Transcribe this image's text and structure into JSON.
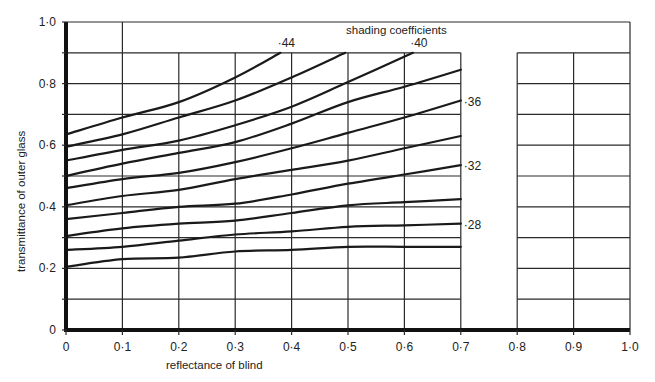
{
  "chart_data": {
    "type": "line",
    "title": "shading coefficients",
    "xlabel": "reflectance of blind",
    "ylabel": "transmittance of outer glass",
    "xlim": [
      0,
      1.0
    ],
    "ylim": [
      0,
      1.0
    ],
    "x_ticks": [
      "0",
      "0·1",
      "0·2",
      "0·3",
      "0·4",
      "0·5",
      "0·6",
      "0·7",
      "0·8",
      "0·9",
      "1·0"
    ],
    "y_ticks": [
      "0",
      "0·2",
      "0·4",
      "0·6",
      "0·8",
      "1·0"
    ],
    "grid": true,
    "grid_step": 0.1,
    "legend": "inline curve labels",
    "x": [
      0,
      0.1,
      0.2,
      0.3,
      0.4,
      0.5,
      0.6,
      0.7
    ],
    "series": [
      {
        "name": "·44",
        "labeled": true,
        "points": [
          [
            0,
            0.635
          ],
          [
            0.1,
            0.69
          ],
          [
            0.2,
            0.74
          ],
          [
            0.3,
            0.82
          ],
          [
            0.38,
            0.9
          ]
        ]
      },
      {
        "name": "·42",
        "labeled": false,
        "points": [
          [
            0,
            0.595
          ],
          [
            0.1,
            0.635
          ],
          [
            0.2,
            0.69
          ],
          [
            0.3,
            0.745
          ],
          [
            0.4,
            0.82
          ],
          [
            0.495,
            0.9
          ]
        ]
      },
      {
        "name": "·40",
        "labeled": true,
        "points": [
          [
            0,
            0.55
          ],
          [
            0.1,
            0.585
          ],
          [
            0.2,
            0.615
          ],
          [
            0.3,
            0.665
          ],
          [
            0.4,
            0.725
          ],
          [
            0.5,
            0.805
          ],
          [
            0.615,
            0.9
          ]
        ]
      },
      {
        "name": "·38",
        "labeled": false,
        "points": [
          [
            0,
            0.5
          ],
          [
            0.1,
            0.54
          ],
          [
            0.2,
            0.575
          ],
          [
            0.3,
            0.61
          ],
          [
            0.4,
            0.67
          ],
          [
            0.5,
            0.74
          ],
          [
            0.6,
            0.79
          ],
          [
            0.7,
            0.845
          ]
        ]
      },
      {
        "name": "·36",
        "labeled": true,
        "points": [
          [
            0,
            0.46
          ],
          [
            0.1,
            0.49
          ],
          [
            0.2,
            0.51
          ],
          [
            0.3,
            0.545
          ],
          [
            0.4,
            0.59
          ],
          [
            0.5,
            0.64
          ],
          [
            0.6,
            0.69
          ],
          [
            0.7,
            0.745
          ]
        ]
      },
      {
        "name": "·34",
        "labeled": false,
        "points": [
          [
            0,
            0.405
          ],
          [
            0.1,
            0.435
          ],
          [
            0.2,
            0.455
          ],
          [
            0.3,
            0.49
          ],
          [
            0.4,
            0.52
          ],
          [
            0.5,
            0.55
          ],
          [
            0.6,
            0.59
          ],
          [
            0.7,
            0.63
          ]
        ]
      },
      {
        "name": "·32",
        "labeled": true,
        "points": [
          [
            0,
            0.36
          ],
          [
            0.1,
            0.38
          ],
          [
            0.2,
            0.4
          ],
          [
            0.3,
            0.41
          ],
          [
            0.4,
            0.44
          ],
          [
            0.5,
            0.475
          ],
          [
            0.6,
            0.505
          ],
          [
            0.7,
            0.535
          ]
        ]
      },
      {
        "name": "·30",
        "labeled": false,
        "points": [
          [
            0,
            0.305
          ],
          [
            0.1,
            0.33
          ],
          [
            0.2,
            0.345
          ],
          [
            0.3,
            0.355
          ],
          [
            0.4,
            0.38
          ],
          [
            0.5,
            0.405
          ],
          [
            0.6,
            0.415
          ],
          [
            0.7,
            0.425
          ]
        ]
      },
      {
        "name": "·28",
        "labeled": true,
        "points": [
          [
            0,
            0.26
          ],
          [
            0.1,
            0.27
          ],
          [
            0.2,
            0.29
          ],
          [
            0.3,
            0.31
          ],
          [
            0.4,
            0.32
          ],
          [
            0.5,
            0.335
          ],
          [
            0.6,
            0.34
          ],
          [
            0.7,
            0.345
          ]
        ]
      },
      {
        "name": "·26",
        "labeled": false,
        "points": [
          [
            0,
            0.205
          ],
          [
            0.1,
            0.23
          ],
          [
            0.2,
            0.235
          ],
          [
            0.3,
            0.255
          ],
          [
            0.4,
            0.26
          ],
          [
            0.5,
            0.27
          ],
          [
            0.6,
            0.27
          ],
          [
            0.7,
            0.27
          ]
        ]
      }
    ],
    "curve_labels": [
      {
        "text": "·44",
        "x": 0.38,
        "y": 0.9,
        "position": "above"
      },
      {
        "text": "·40",
        "x": 0.615,
        "y": 0.9,
        "position": "above"
      },
      {
        "text": "·36",
        "x": 0.7,
        "y": 0.745,
        "position": "right"
      },
      {
        "text": "·32",
        "x": 0.7,
        "y": 0.535,
        "position": "right"
      },
      {
        "text": "·28",
        "x": 0.7,
        "y": 0.345,
        "position": "right"
      }
    ]
  },
  "colors": {
    "line": "#1a1a1a",
    "grid": "#2a2a2a",
    "background": "#ffffff"
  }
}
